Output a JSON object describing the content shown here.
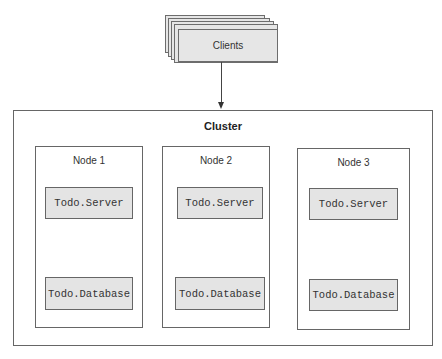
{
  "clients": {
    "label": "Clients",
    "stack_count": 5
  },
  "cluster": {
    "title": "Cluster"
  },
  "nodes": [
    {
      "title": "Node 1",
      "server": "Todo.Server",
      "database": "Todo.Database"
    },
    {
      "title": "Node 2",
      "server": "Todo.Server",
      "database": "Todo.Database"
    },
    {
      "title": "Node 3",
      "server": "Todo.Server",
      "database": "Todo.Database"
    }
  ],
  "colors": {
    "box_fill": "#e4e4e4",
    "border": "#666666",
    "background": "#ffffff"
  }
}
